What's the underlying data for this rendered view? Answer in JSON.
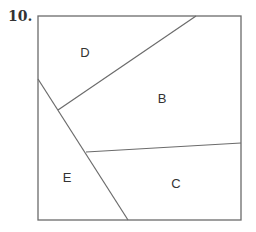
{
  "problem": {
    "number_label": "10."
  },
  "diagram": {
    "stroke_color": "#6b6b6b",
    "square": {
      "x1": 38,
      "y1": 16,
      "x2": 241,
      "y2": 220
    },
    "lines": [
      {
        "name": "line-d-b",
        "x1": 196,
        "y1": 16,
        "x2": 58,
        "y2": 110
      },
      {
        "name": "line-e",
        "x1": 38,
        "y1": 79,
        "x2": 128,
        "y2": 220
      },
      {
        "name": "line-b-c",
        "x1": 86,
        "y1": 152,
        "x2": 241,
        "y2": 143
      }
    ],
    "regions": [
      {
        "label": "D",
        "x": 85,
        "y": 57
      },
      {
        "label": "B",
        "x": 162,
        "y": 103
      },
      {
        "label": "E",
        "x": 67,
        "y": 182
      },
      {
        "label": "C",
        "x": 176,
        "y": 188
      }
    ]
  }
}
